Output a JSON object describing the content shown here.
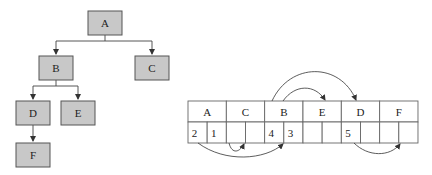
{
  "tree": {
    "nodes": [
      {
        "id": "A",
        "label": "A",
        "x": 88,
        "y": 11,
        "w": 34,
        "h": 24
      },
      {
        "id": "B",
        "label": "B",
        "x": 39,
        "y": 56,
        "w": 34,
        "h": 24
      },
      {
        "id": "C",
        "label": "C",
        "x": 135,
        "y": 56,
        "w": 34,
        "h": 24
      },
      {
        "id": "D",
        "label": "D",
        "x": 16,
        "y": 101,
        "w": 34,
        "h": 24
      },
      {
        "id": "E",
        "label": "E",
        "x": 61,
        "y": 101,
        "w": 34,
        "h": 24
      },
      {
        "id": "F",
        "label": "F",
        "x": 16,
        "y": 143,
        "w": 34,
        "h": 24
      }
    ],
    "edges": [
      {
        "from": "A",
        "to": "B"
      },
      {
        "from": "A",
        "to": "C"
      },
      {
        "from": "B",
        "to": "D"
      },
      {
        "from": "B",
        "to": "E"
      },
      {
        "from": "D",
        "to": "F"
      }
    ]
  },
  "table": {
    "headers": [
      "A",
      "C",
      "B",
      "E",
      "D",
      "F"
    ],
    "cells": [
      [
        "2",
        "1"
      ],
      [
        "",
        ""
      ],
      [
        "4",
        "3"
      ],
      [
        "",
        ""
      ],
      [
        "5",
        ""
      ],
      [
        "",
        ""
      ]
    ]
  },
  "colors": {
    "node_fill": "#c8c8c8",
    "node_stroke": "#555555",
    "line": "#444444"
  }
}
